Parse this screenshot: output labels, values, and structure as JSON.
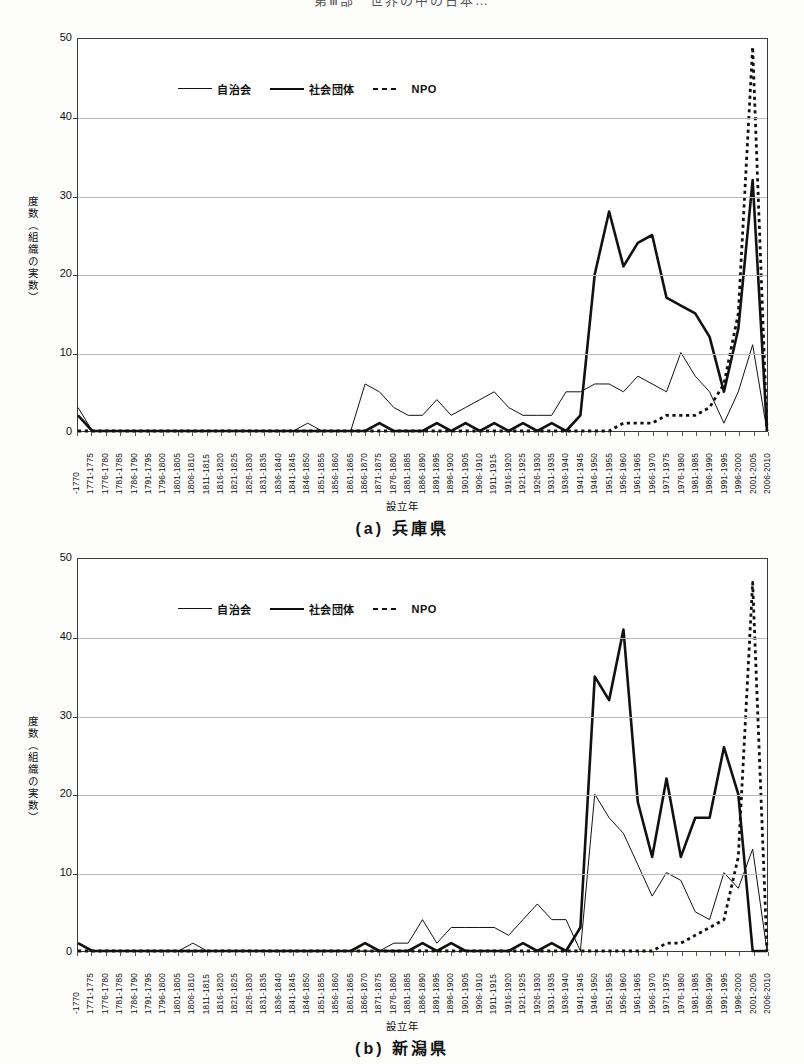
{
  "page_header": "第Ⅲ部　世界の中の日本…",
  "figures": [
    {
      "id": "a",
      "caption": "(a) 兵庫県",
      "legend": [
        {
          "key": "thin",
          "label": "自治会"
        },
        {
          "key": "thick",
          "label": "社会団体"
        },
        {
          "key": "dot",
          "label": "NPO"
        }
      ],
      "chart_data": {
        "type": "line",
        "title": "(a) 兵庫県",
        "xlabel": "設立年",
        "ylabel": "度数（組織の実数）",
        "ylim": [
          0,
          50
        ],
        "yticks": [
          0,
          10,
          20,
          30,
          40,
          50
        ],
        "grid": true,
        "legend_position": "top-left",
        "categories": [
          "-1770",
          "1771-1775",
          "1776-1780",
          "1781-1785",
          "1786-1790",
          "1791-1795",
          "1796-1800",
          "1801-1805",
          "1806-1810",
          "1811-1815",
          "1816-1820",
          "1821-1825",
          "1826-1830",
          "1831-1835",
          "1836-1840",
          "1841-1845",
          "1846-1850",
          "1851-1855",
          "1856-1860",
          "1861-1865",
          "1866-1870",
          "1871-1875",
          "1876-1880",
          "1881-1885",
          "1886-1890",
          "1891-1895",
          "1896-1900",
          "1901-1905",
          "1906-1910",
          "1911-1915",
          "1916-1920",
          "1921-1925",
          "1926-1930",
          "1931-1935",
          "1936-1940",
          "1941-1945",
          "1946-1950",
          "1951-1955",
          "1956-1960",
          "1961-1965",
          "1966-1970",
          "1971-1975",
          "1976-1980",
          "1981-1985",
          "1986-1990",
          "1991-1995",
          "1996-2000",
          "2001-2005",
          "2006-2010"
        ],
        "series": [
          {
            "name": "自治会",
            "style": "thin-solid",
            "values": [
              3,
              0,
              0,
              0,
              0,
              0,
              0,
              0,
              0,
              0,
              0,
              0,
              0,
              0,
              0,
              0,
              1,
              0,
              0,
              0,
              6,
              5,
              3,
              2,
              2,
              4,
              2,
              3,
              4,
              5,
              3,
              2,
              2,
              2,
              5,
              5,
              6,
              6,
              5,
              7,
              6,
              5,
              10,
              7,
              5,
              1,
              5,
              11,
              0
            ]
          },
          {
            "name": "社会団体",
            "style": "thick-solid",
            "values": [
              2,
              0,
              0,
              0,
              0,
              0,
              0,
              0,
              0,
              0,
              0,
              0,
              0,
              0,
              0,
              0,
              0,
              0,
              0,
              0,
              0,
              1,
              0,
              0,
              0,
              1,
              0,
              1,
              0,
              1,
              0,
              1,
              0,
              1,
              0,
              2,
              20,
              28,
              21,
              24,
              25,
              17,
              16,
              15,
              12,
              5,
              13,
              32,
              0
            ]
          },
          {
            "name": "NPO",
            "style": "dotted",
            "values": [
              0,
              0,
              0,
              0,
              0,
              0,
              0,
              0,
              0,
              0,
              0,
              0,
              0,
              0,
              0,
              0,
              0,
              0,
              0,
              0,
              0,
              0,
              0,
              0,
              0,
              0,
              0,
              0,
              0,
              0,
              0,
              0,
              0,
              0,
              0,
              0,
              0,
              0,
              1,
              1,
              1,
              2,
              2,
              2,
              3,
              6,
              15,
              49,
              0
            ]
          }
        ]
      }
    },
    {
      "id": "b",
      "caption": "(b) 新潟県",
      "legend": [
        {
          "key": "thin",
          "label": "自治会"
        },
        {
          "key": "thick",
          "label": "社会団体"
        },
        {
          "key": "dot",
          "label": "NPO"
        }
      ],
      "chart_data": {
        "type": "line",
        "title": "(b) 新潟県",
        "xlabel": "設立年",
        "ylabel": "度数（組織の実数）",
        "ylim": [
          0,
          50
        ],
        "yticks": [
          0,
          10,
          20,
          30,
          40,
          50
        ],
        "grid": true,
        "legend_position": "top-left",
        "categories": [
          "-1770",
          "1771-1775",
          "1776-1780",
          "1781-1785",
          "1786-1790",
          "1791-1795",
          "1796-1800",
          "1801-1805",
          "1806-1810",
          "1811-1815",
          "1816-1820",
          "1821-1825",
          "1826-1830",
          "1831-1835",
          "1836-1840",
          "1841-1845",
          "1846-1850",
          "1851-1855",
          "1856-1860",
          "1861-1865",
          "1866-1870",
          "1871-1875",
          "1876-1880",
          "1881-1885",
          "1886-1890",
          "1891-1895",
          "1896-1900",
          "1901-1905",
          "1906-1910",
          "1911-1915",
          "1916-1920",
          "1921-1925",
          "1926-1930",
          "1931-1935",
          "1936-1940",
          "1941-1945",
          "1946-1950",
          "1951-1955",
          "1956-1960",
          "1961-1965",
          "1966-1970",
          "1971-1975",
          "1976-1980",
          "1981-1985",
          "1986-1990",
          "1991-1995",
          "1996-2000",
          "2001-2005",
          "2006-2010"
        ],
        "series": [
          {
            "name": "自治会",
            "style": "thin-solid",
            "values": [
              1,
              0,
              0,
              0,
              0,
              0,
              0,
              0,
              1,
              0,
              0,
              0,
              0,
              0,
              0,
              0,
              0,
              0,
              0,
              0,
              0,
              0,
              1,
              1,
              4,
              1,
              3,
              3,
              3,
              3,
              2,
              4,
              6,
              4,
              4,
              0,
              20,
              17,
              15,
              11,
              7,
              10,
              9,
              5,
              4,
              10,
              8,
              13,
              0
            ]
          },
          {
            "name": "社会団体",
            "style": "thick-solid",
            "values": [
              1,
              0,
              0,
              0,
              0,
              0,
              0,
              0,
              0,
              0,
              0,
              0,
              0,
              0,
              0,
              0,
              0,
              0,
              0,
              0,
              1,
              0,
              0,
              0,
              1,
              0,
              1,
              0,
              0,
              0,
              0,
              1,
              0,
              1,
              0,
              3,
              35,
              32,
              41,
              19,
              12,
              22,
              12,
              17,
              17,
              26,
              20,
              0,
              0
            ]
          },
          {
            "name": "NPO",
            "style": "dotted",
            "values": [
              0,
              0,
              0,
              0,
              0,
              0,
              0,
              0,
              0,
              0,
              0,
              0,
              0,
              0,
              0,
              0,
              0,
              0,
              0,
              0,
              0,
              0,
              0,
              0,
              0,
              0,
              0,
              0,
              0,
              0,
              0,
              0,
              0,
              0,
              0,
              0,
              0,
              0,
              0,
              0,
              0,
              1,
              1,
              2,
              3,
              4,
              12,
              47,
              0
            ]
          }
        ]
      }
    }
  ]
}
